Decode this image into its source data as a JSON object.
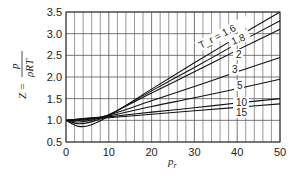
{
  "chart_data": {
    "type": "line",
    "title": "",
    "xlabel": "p_r",
    "ylabel": "Z = p / (ρRT)",
    "xlim": [
      0,
      50
    ],
    "ylim": [
      0.5,
      3.5
    ],
    "xticks": [
      "0",
      "10",
      "20",
      "30",
      "40",
      "50"
    ],
    "yticks": [
      "0.5",
      "1.0",
      "1.5",
      "2.0",
      "2.5",
      "3.0",
      "3.5"
    ],
    "grid": true,
    "legend": "inline curve labels",
    "x": [
      0,
      3,
      6,
      10,
      20,
      30,
      40,
      50
    ],
    "series": [
      {
        "name": "T_r = 1.6",
        "label": "T_r = 1.6",
        "values": [
          1.0,
          0.86,
          0.9,
          1.1,
          1.72,
          2.33,
          2.92,
          3.5
        ]
      },
      {
        "name": "1.8",
        "label": "1.8",
        "values": [
          1.0,
          0.92,
          0.97,
          1.12,
          1.68,
          2.22,
          2.77,
          3.3
        ]
      },
      {
        "name": "2",
        "label": "2",
        "values": [
          1.0,
          0.96,
          1.01,
          1.13,
          1.63,
          2.12,
          2.62,
          3.1
        ]
      },
      {
        "name": "3",
        "label": "3",
        "values": [
          1.0,
          1.0,
          1.04,
          1.12,
          1.45,
          1.78,
          2.12,
          2.45
        ]
      },
      {
        "name": "5",
        "label": "5",
        "values": [
          1.0,
          1.03,
          1.06,
          1.1,
          1.32,
          1.52,
          1.73,
          1.95
        ]
      },
      {
        "name": "10",
        "label": "10",
        "values": [
          1.0,
          1.03,
          1.05,
          1.08,
          1.19,
          1.29,
          1.4,
          1.5
        ]
      },
      {
        "name": "15",
        "label": "15",
        "values": [
          1.0,
          1.02,
          1.04,
          1.06,
          1.14,
          1.22,
          1.3,
          1.38
        ]
      }
    ]
  },
  "axis": {
    "ylabel_z": "Z =",
    "ylabel_num": "p",
    "ylabel_den": "ρRT",
    "xlabel_main": "p",
    "xlabel_sub": "r"
  }
}
